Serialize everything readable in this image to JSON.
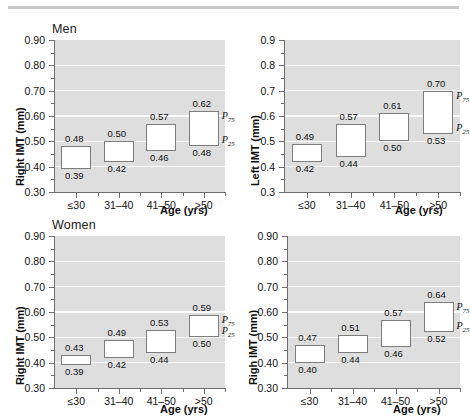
{
  "figure": {
    "panels": [
      {
        "id": "top-left",
        "group_label": "Men",
        "ylabel": "Right IMT (mm)",
        "xlabel": "Age (yrs)",
        "ytick_labels": [
          "0.90",
          "0.80",
          "0.70",
          "0.60",
          "0.50",
          "0.40",
          "0.30"
        ],
        "p75_label": "P",
        "p75_sub": "75",
        "p25_label": "P",
        "p25_sub": "25"
      },
      {
        "id": "top-right",
        "group_label": "",
        "ylabel": "Left IMT (mm)",
        "xlabel": "Age (yrs)",
        "ytick_labels": [
          "0.9",
          "0.8",
          "0.7",
          "0.6",
          "0.5",
          "0.4",
          "0.3"
        ],
        "p75_label": "P",
        "p75_sub": "75",
        "p25_label": "P",
        "p25_sub": "25"
      },
      {
        "id": "bottom-left",
        "group_label": "Women",
        "ylabel": "Right IMT (mm)",
        "xlabel": "Age (yrs)",
        "ytick_labels": [
          "0.90",
          "0.80",
          "0.70",
          "0.60",
          "0.50",
          "0.40",
          "0.30"
        ],
        "p75_label": "P",
        "p75_sub": "75",
        "p25_label": "P",
        "p25_sub": "25"
      },
      {
        "id": "bottom-right",
        "group_label": "",
        "ylabel": "Righ IMT (mm)",
        "xlabel": "Age (yrs)",
        "ytick_labels": [
          "0.90",
          "0.80",
          "0.70",
          "0.60",
          "0.50",
          "0.40",
          "0.30"
        ],
        "p75_label": "P",
        "p75_sub": "75",
        "p25_label": "P",
        "p25_sub": "25"
      }
    ]
  },
  "chart_data": [
    {
      "type": "bar",
      "id": "top-left",
      "title": "Men",
      "xlabel": "Age (yrs)",
      "ylabel": "Right IMT (mm)",
      "ylim": [
        0.3,
        0.9
      ],
      "yticks": [
        0.3,
        0.4,
        0.5,
        0.6,
        0.7,
        0.8,
        0.9
      ],
      "ytick_labels": [
        "0.30",
        "0.40",
        "0.50",
        "0.60",
        "0.70",
        "0.80",
        "0.90"
      ],
      "grid": true,
      "legend": "none",
      "categories": [
        "≤30",
        "31–40",
        "41–50",
        ">50"
      ],
      "series": [
        {
          "name": "P25",
          "values": [
            0.39,
            0.42,
            0.46,
            0.48
          ]
        },
        {
          "name": "P75",
          "values": [
            0.48,
            0.5,
            0.57,
            0.62
          ]
        }
      ],
      "p75_labels": [
        "0.48",
        "0.50",
        "0.57",
        "0.62"
      ],
      "p25_labels": [
        "0.39",
        "0.42",
        "0.46",
        "0.48"
      ],
      "annotations": [
        "P75",
        "P25"
      ]
    },
    {
      "type": "bar",
      "id": "top-right",
      "title": "",
      "xlabel": "Age (yrs)",
      "ylabel": "Left IMT (mm)",
      "ylim": [
        0.3,
        0.9
      ],
      "yticks": [
        0.3,
        0.4,
        0.5,
        0.6,
        0.7,
        0.8,
        0.9
      ],
      "ytick_labels": [
        "0.3",
        "0.4",
        "0.5",
        "0.6",
        "0.7",
        "0.8",
        "0.9"
      ],
      "grid": true,
      "legend": "none",
      "categories": [
        "≤30",
        "31–40",
        "41–50",
        ">50"
      ],
      "series": [
        {
          "name": "P25",
          "values": [
            0.42,
            0.44,
            0.5,
            0.53
          ]
        },
        {
          "name": "P75",
          "values": [
            0.49,
            0.57,
            0.61,
            0.7
          ]
        }
      ],
      "p75_labels": [
        "0.49",
        "0.57",
        "0.61",
        "0.70"
      ],
      "p25_labels": [
        "0.42",
        "0.44",
        "0.50",
        "0.53"
      ],
      "annotations": [
        "P75",
        "P25"
      ]
    },
    {
      "type": "bar",
      "id": "bottom-left",
      "title": "Women",
      "xlabel": "Age (yrs)",
      "ylabel": "Right IMT (mm)",
      "ylim": [
        0.3,
        0.9
      ],
      "yticks": [
        0.3,
        0.4,
        0.5,
        0.6,
        0.7,
        0.8,
        0.9
      ],
      "ytick_labels": [
        "0.30",
        "0.40",
        "0.50",
        "0.60",
        "0.70",
        "0.80",
        "0.90"
      ],
      "grid": true,
      "legend": "none",
      "categories": [
        "≤30",
        "31–40",
        "41–50",
        ">50"
      ],
      "series": [
        {
          "name": "P25",
          "values": [
            0.39,
            0.42,
            0.44,
            0.5
          ]
        },
        {
          "name": "P75",
          "values": [
            0.43,
            0.49,
            0.53,
            0.59
          ]
        }
      ],
      "p75_labels": [
        "0.43",
        "0.49",
        "0.53",
        "0.59"
      ],
      "p25_labels": [
        "0.39",
        "0.42",
        "0.44",
        "0.50"
      ],
      "annotations": [
        "P75",
        "P25"
      ]
    },
    {
      "type": "bar",
      "id": "bottom-right",
      "title": "",
      "xlabel": "Age (yrs)",
      "ylabel": "Righ IMT (mm)",
      "ylim": [
        0.3,
        0.9
      ],
      "yticks": [
        0.3,
        0.4,
        0.5,
        0.6,
        0.7,
        0.8,
        0.9
      ],
      "ytick_labels": [
        "0.30",
        "0.40",
        "0.50",
        "0.60",
        "0.70",
        "0.80",
        "0.90"
      ],
      "grid": true,
      "legend": "none",
      "categories": [
        "≤30",
        "31–40",
        "41–50",
        ">50"
      ],
      "series": [
        {
          "name": "P25",
          "values": [
            0.4,
            0.44,
            0.46,
            0.52
          ]
        },
        {
          "name": "P75",
          "values": [
            0.47,
            0.51,
            0.57,
            0.64
          ]
        }
      ],
      "p75_labels": [
        "0.47",
        "0.51",
        "0.57",
        "0.64"
      ],
      "p25_labels": [
        "0.40",
        "0.44",
        "0.46",
        "0.52"
      ],
      "annotations": [
        "P75",
        "P25"
      ]
    }
  ]
}
